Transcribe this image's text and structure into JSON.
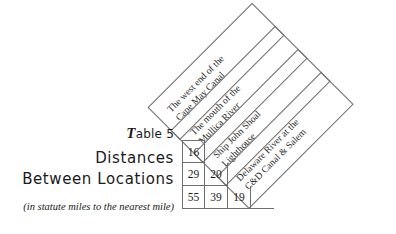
{
  "caption": {
    "table_number_prefix": "T",
    "table_number_rest": "able 5",
    "title_line_1": "Distances",
    "title_line_2": "Between Locations",
    "subcaption": "(in statute miles to the nearest mile)"
  },
  "chart_data": {
    "type": "table",
    "title": "Distances Between Locations",
    "subtitle": "(in statute miles to the nearest mile)",
    "table_label": "Table 5",
    "units": "statute miles",
    "note": "Lower-triangular distance matrix; headers are rotated 45 degrees.",
    "categories": [
      "The west end of the Cape May Canal",
      "The mouth of the Mullica River",
      "Ship John Shoal Lighthouse",
      "Delaware River at the C&D Canal & Salem"
    ],
    "rows": [
      {
        "values": [
          16
        ]
      },
      {
        "values": [
          29,
          20
        ]
      },
      {
        "values": [
          55,
          39,
          19
        ]
      }
    ],
    "matrix": [
      [
        null,
        null,
        null,
        null
      ],
      [
        16,
        null,
        null,
        null
      ],
      [
        29,
        20,
        null,
        null
      ],
      [
        55,
        39,
        19,
        null
      ]
    ]
  },
  "headers": [
    {
      "id": "header-cape-may-canal",
      "line_1": "The west end of the",
      "line_2": "Cape May Canal",
      "text": "The west end of the\nCape May Canal",
      "left": 180,
      "top": 140
    },
    {
      "id": "header-mullica-river",
      "line_1": "The mouth of the",
      "line_2": "Mullica River",
      "text": "The mouth of the\nMullica River",
      "left": 203,
      "top": 163
    },
    {
      "id": "header-ship-john-shoal",
      "line_1": "Ship John Shoal",
      "line_2": "Lighthouse",
      "text": "Ship John Shoal\nLighthouse",
      "left": 226,
      "top": 186
    },
    {
      "id": "header-delaware-river",
      "line_1": "Delaware River at the",
      "line_2": "C&D Canal & Salem",
      "text": "Delaware River at the\nC&D Canal & Salem",
      "left": 249,
      "top": 209
    }
  ],
  "grid": {
    "rows": [
      {
        "cells": [
          "16"
        ]
      },
      {
        "cells": [
          "29",
          "20"
        ]
      },
      {
        "cells": [
          "55",
          "39",
          "19",
          ""
        ]
      }
    ]
  },
  "colors": {
    "line": "#6e6e6e",
    "text": "#1a1a1a",
    "header_text": "#2a2a2a",
    "background": "#ffffff"
  }
}
